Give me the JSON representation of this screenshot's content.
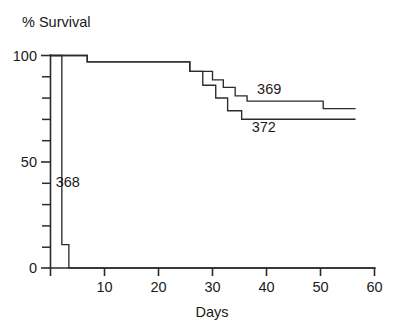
{
  "chart_data": {
    "type": "line",
    "title": "",
    "ylabel": "% Survival",
    "xlabel": "Days",
    "xlim": [
      0,
      60
    ],
    "ylim": [
      0,
      100
    ],
    "grid": false,
    "legend_position": "inline-annotations",
    "x_ticks": [
      0,
      10,
      20,
      30,
      40,
      50,
      60
    ],
    "x_tick_labels": [
      "0",
      "10",
      "20",
      "30",
      "40",
      "50",
      "60"
    ],
    "y_ticks": [
      0,
      10,
      20,
      30,
      40,
      50,
      60,
      70,
      80,
      90,
      100
    ],
    "y_tick_labels": [
      "0",
      "",
      "",
      "",
      "",
      "50",
      "",
      "",
      "",
      "",
      "100"
    ],
    "y_labeled_ticks": [
      {
        "value": 0,
        "label": "0"
      },
      {
        "value": 50,
        "label": "50"
      },
      {
        "value": 100,
        "label": "100"
      }
    ],
    "series": [
      {
        "name": "368",
        "annotation": "368",
        "step": "post",
        "x": [
          0,
          2.1,
          2.1,
          3.4,
          3.4,
          60
        ],
        "y": [
          100,
          100,
          11,
          11,
          0,
          0
        ]
      },
      {
        "name": "369",
        "annotation": "369",
        "step": "post",
        "x": [
          0,
          6.8,
          6.8,
          25.8,
          25.8,
          30.0,
          30.0,
          32.0,
          32.0,
          34.2,
          34.2,
          36.4,
          36.4,
          50.5,
          50.5,
          56.5
        ],
        "y": [
          100,
          100,
          97,
          97,
          92.5,
          92.5,
          88.5,
          88.5,
          85,
          85,
          81,
          81,
          78.5,
          78.5,
          75,
          75
        ]
      },
      {
        "name": "372",
        "annotation": "372",
        "step": "post",
        "x": [
          0,
          6.8,
          6.8,
          25.8,
          25.8,
          28.2,
          28.2,
          30.6,
          30.6,
          32.8,
          32.8,
          35.4,
          35.4,
          56.5
        ],
        "y": [
          100,
          100,
          97,
          97,
          92.5,
          92.5,
          86,
          86,
          80,
          80,
          74,
          74,
          70,
          70
        ]
      }
    ],
    "annotations": [
      {
        "text": "368",
        "x_days": 3.2,
        "y_pct": 38
      },
      {
        "text": "369",
        "x_days": 40.5,
        "y_pct": 82
      },
      {
        "text": "372",
        "x_days": 39.5,
        "y_pct": 64
      }
    ]
  }
}
